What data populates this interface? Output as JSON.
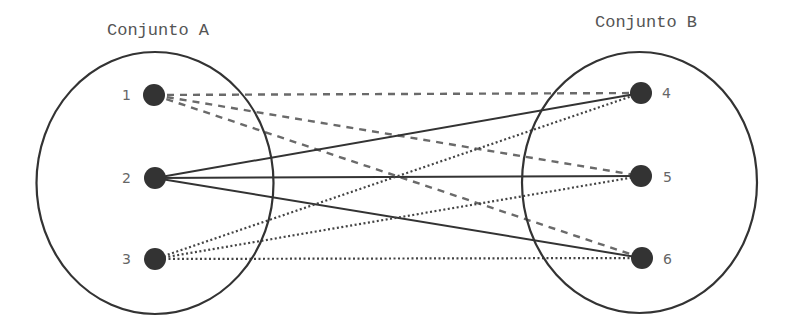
{
  "diagram": {
    "type": "set-mapping",
    "sets": [
      {
        "id": "A",
        "title": "Conjunto A",
        "elements": [
          "1",
          "2",
          "3"
        ]
      },
      {
        "id": "B",
        "title": "Conjunto B",
        "elements": [
          "4",
          "5",
          "6"
        ]
      }
    ],
    "edge_styles": {
      "1": "dashed",
      "2": "solid",
      "3": "dotted"
    },
    "edges": [
      {
        "from": "1",
        "to": "4",
        "style": "dashed"
      },
      {
        "from": "1",
        "to": "5",
        "style": "dashed"
      },
      {
        "from": "1",
        "to": "6",
        "style": "dashed"
      },
      {
        "from": "2",
        "to": "4",
        "style": "solid"
      },
      {
        "from": "2",
        "to": "5",
        "style": "solid"
      },
      {
        "from": "2",
        "to": "6",
        "style": "solid"
      },
      {
        "from": "3",
        "to": "4",
        "style": "dotted"
      },
      {
        "from": "3",
        "to": "5",
        "style": "dotted"
      },
      {
        "from": "3",
        "to": "6",
        "style": "dotted"
      }
    ]
  }
}
